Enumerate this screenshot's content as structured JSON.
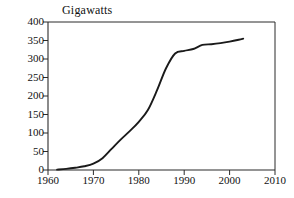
{
  "chart_data": {
    "type": "line",
    "title": "Gigawatts",
    "xlabel": "",
    "ylabel": "Gigawatts",
    "xlim": [
      1960,
      2010
    ],
    "ylim": [
      0,
      400
    ],
    "grid": false,
    "legend": null,
    "xticks": [
      1960,
      1970,
      1980,
      1990,
      2000,
      2010
    ],
    "xtick_labels": [
      "1960",
      "1970",
      "1980",
      "1990",
      "2000",
      "2010"
    ],
    "yticks": [
      0,
      50,
      100,
      150,
      200,
      250,
      300,
      350,
      400
    ],
    "ytick_labels": [
      "0",
      "50",
      "100",
      "150",
      "200",
      "250",
      "300",
      "350",
      "400"
    ],
    "series": [
      {
        "name": "Installed nuclear capacity",
        "color": "#1a1a1a",
        "x": [
          1962,
          1964,
          1966,
          1968,
          1970,
          1972,
          1974,
          1976,
          1978,
          1980,
          1982,
          1984,
          1986,
          1988,
          1990,
          1992,
          1994,
          1996,
          1998,
          2000,
          2002,
          2003
        ],
        "values": [
          1,
          3,
          6,
          10,
          17,
          32,
          57,
          82,
          105,
          130,
          162,
          215,
          275,
          315,
          322,
          327,
          338,
          340,
          343,
          347,
          352,
          355
        ]
      }
    ]
  },
  "axes": {
    "frame_color": "#2b2b2b",
    "tick_color": "#2b2b2b",
    "line_color": "#1a1a1a"
  }
}
